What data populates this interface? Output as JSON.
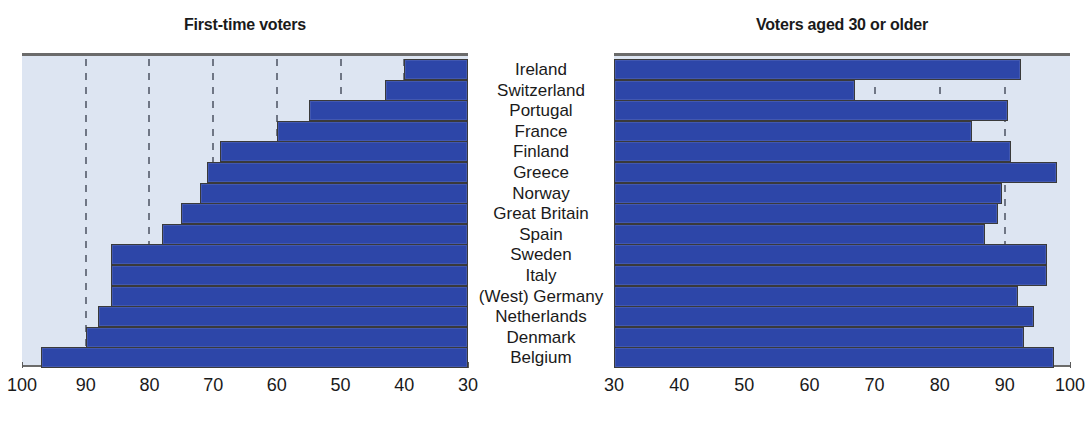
{
  "chart_data": {
    "type": "bar",
    "title": "",
    "categories": [
      "Ireland",
      "Switzerland",
      "Portugal",
      "France",
      "Finland",
      "Greece",
      "Norway",
      "Great Britain",
      "Spain",
      "Sweden",
      "Italy",
      "(West) Germany",
      "Netherlands",
      "Denmark",
      "Belgium"
    ],
    "panels": [
      {
        "title": "First-time voters",
        "xlabel": "",
        "ylabel": "",
        "orientation": "horizontal-rtl",
        "axis_reversed": true,
        "xlim": [
          100,
          30
        ],
        "ticks": [
          100,
          90,
          80,
          70,
          60,
          50,
          40,
          30
        ],
        "tick_labels": [
          "100",
          "90",
          "80",
          "70",
          "60",
          "50",
          "40",
          "30"
        ],
        "grid": true,
        "values": [
          40,
          43,
          55,
          60,
          69,
          71,
          72,
          75,
          78,
          86,
          86,
          86,
          88,
          90,
          97
        ]
      },
      {
        "title": "Voters aged 30 or older",
        "xlabel": "",
        "ylabel": "",
        "orientation": "horizontal-ltr",
        "axis_reversed": false,
        "xlim": [
          30,
          100
        ],
        "ticks": [
          30,
          40,
          50,
          60,
          70,
          80,
          90,
          100
        ],
        "tick_labels": [
          "30",
          "40",
          "50",
          "60",
          "70",
          "80",
          "90",
          "100"
        ],
        "grid": true,
        "values": [
          92.5,
          67,
          90.5,
          85,
          91,
          98,
          89.5,
          89,
          87,
          96.5,
          96.5,
          92,
          94.5,
          93,
          97.5
        ]
      }
    ],
    "colors": {
      "bar": "#2d46a8",
      "plot_background": "#dde5f2",
      "gridline": "#6f7685",
      "axis": "#6b6b6b",
      "text": "#1a1a1a"
    }
  }
}
